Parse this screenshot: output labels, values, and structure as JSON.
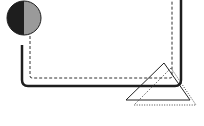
{
  "diagram": {
    "background": "#ffffff",
    "circle": {
      "cx": 24,
      "cy": 18,
      "r": 17,
      "left_color": "#1e1e1e",
      "right_color": "#9a9a9a",
      "stroke": "#1e1e1e"
    },
    "solid_path": {
      "color": "#1e1e1e",
      "width": 2.5
    },
    "dashed_path": {
      "color": "#333333",
      "width": 1
    },
    "solid_triangle": {
      "color": "#222222"
    },
    "dotted_triangle": {
      "color": "#444444"
    }
  }
}
